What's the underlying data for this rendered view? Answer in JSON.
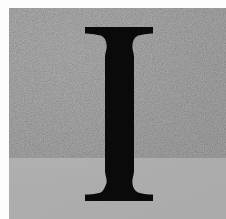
{
  "image": {
    "kind": "letter-specimen",
    "width": 226,
    "height": 219,
    "alt_text": "Black serif capital letter I on a gray background"
  },
  "plate": {
    "background_color": "#b0b0b0",
    "margin_color": "#fdfdfd",
    "margin_top_px": 8,
    "margin_left_px": 9
  },
  "glyph": {
    "character": "I",
    "name": "capital-letter-i",
    "style": "serif",
    "color": "#0a0a0a",
    "cap_top_px": 27,
    "baseline_px": 201,
    "serif_left_px": 85,
    "serif_right_px": 153,
    "stem_left_px": 105,
    "stem_right_px": 134,
    "stem_width_px": 29,
    "serif_width_px": 68,
    "glyph_height_px": 174
  },
  "texture": {
    "noise_opacity": 0.55,
    "description": "fine scan grain over gray plate"
  }
}
